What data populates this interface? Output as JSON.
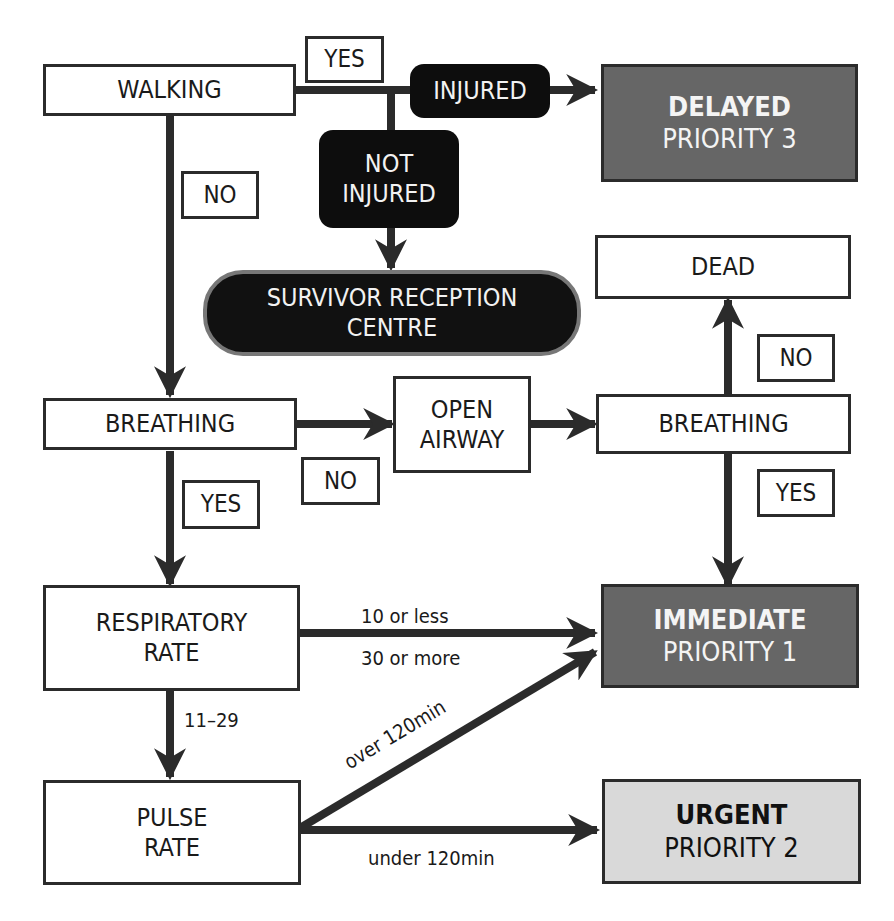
{
  "diagram": {
    "type": "triage-flowchart",
    "nodes": {
      "walking": "WALKING",
      "injured": "INJURED",
      "not_injured_line1": "NOT",
      "not_injured_line2": "INJURED",
      "delayed_title": "DELAYED",
      "delayed_priority": "PRIORITY 3",
      "survivor_line1": "SURVIVOR RECEPTION",
      "survivor_line2": "CENTRE",
      "dead": "DEAD",
      "breathing_1": "BREATHING",
      "open_airway_line1": "OPEN",
      "open_airway_line2": "AIRWAY",
      "breathing_2": "BREATHING",
      "respiratory_line1": "RESPIRATORY",
      "respiratory_line2": "RATE",
      "immediate_title": "IMMEDIATE",
      "immediate_priority": "PRIORITY 1",
      "pulse_line1": "PULSE",
      "pulse_line2": "RATE",
      "urgent_title": "URGENT",
      "urgent_priority": "PRIORITY 2"
    },
    "labels": {
      "walking_yes": "YES",
      "walking_no": "NO",
      "breathing1_no": "NO",
      "breathing1_yes": "YES",
      "breathing2_no": "NO",
      "breathing2_yes": "YES",
      "resp_low": "10 or less",
      "resp_high": "30 or more",
      "resp_mid": "11–29",
      "pulse_over": "over 120min",
      "pulse_under": "under 120min"
    },
    "colors": {
      "line": "#2b2b2b",
      "black_node": "#0d0d0d",
      "delayed_fill": "#666666",
      "immediate_fill": "#666666",
      "urgent_fill": "#d9d9d9",
      "pill_border": "#777777"
    }
  }
}
